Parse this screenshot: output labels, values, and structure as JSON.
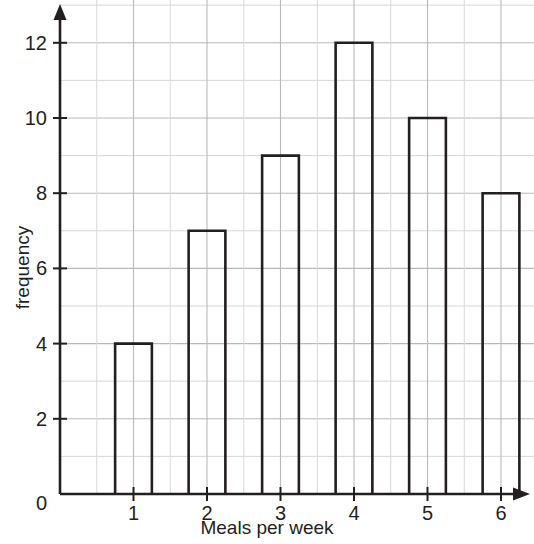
{
  "chart_data": {
    "type": "bar",
    "title": "",
    "subtitle": "",
    "xlabel": "Meals per week",
    "ylabel": "frequency",
    "categories": [
      "1",
      "2",
      "3",
      "4",
      "5",
      "6"
    ],
    "values": [
      4,
      7,
      9,
      12,
      10,
      8
    ],
    "series": [
      {
        "name": "frequency",
        "values": [
          4,
          7,
          9,
          12,
          10,
          8
        ]
      }
    ],
    "xlim": [
      0,
      7
    ],
    "ylim": [
      0,
      13
    ],
    "x_ticks": [
      "0",
      "1",
      "2",
      "3",
      "4",
      "5",
      "6"
    ],
    "y_ticks": [
      "0",
      "2",
      "4",
      "6",
      "8",
      "10",
      "12"
    ],
    "y_tick_values": [
      0,
      2,
      4,
      6,
      8,
      10,
      12
    ],
    "x_minor_step": 0.5,
    "y_minor_step": 1,
    "grid": true,
    "grid_color": "#cccccc",
    "legend": "none",
    "bar_style": "outline",
    "bar_fill": "#ffffff",
    "bar_stroke": "#231f20",
    "axis_color": "#231f20",
    "axis_arrows": true,
    "bar_width_units": 0.5,
    "annotations": []
  },
  "axes": {
    "y_title": "frequency",
    "x_title": "Meals per week",
    "origin_label": "0"
  },
  "ticks": {
    "y": [
      {
        "label": "12",
        "value": 12
      },
      {
        "label": "10",
        "value": 10
      },
      {
        "label": "8",
        "value": 8
      },
      {
        "label": "6",
        "value": 6
      },
      {
        "label": "4",
        "value": 4
      },
      {
        "label": "2",
        "value": 2
      },
      {
        "label": "0",
        "value": 0
      }
    ],
    "x": [
      {
        "label": "1",
        "value": 1
      },
      {
        "label": "2",
        "value": 2
      },
      {
        "label": "3",
        "value": 3
      },
      {
        "label": "4",
        "value": 4
      },
      {
        "label": "5",
        "value": 5
      },
      {
        "label": "6",
        "value": 6
      }
    ]
  }
}
